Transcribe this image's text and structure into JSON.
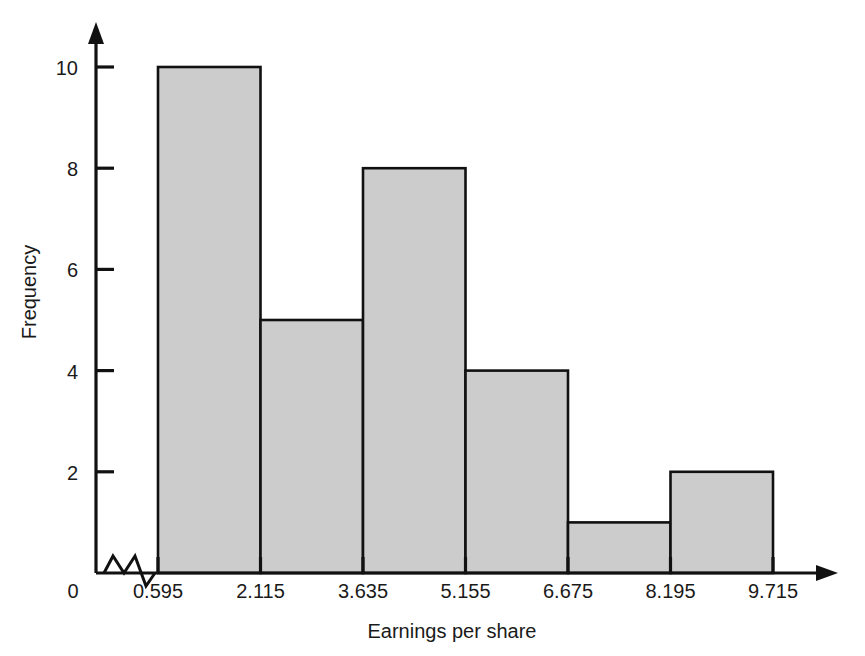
{
  "chart_data": {
    "type": "bar",
    "title": "",
    "subtitle": "",
    "xlabel": "Earnings per share",
    "ylabel": "Frequency",
    "categories": [
      "0.595-2.115",
      "2.115-3.635",
      "3.635-5.155",
      "5.155-6.675",
      "6.675-8.195",
      "8.195-9.715"
    ],
    "bin_edges": [
      0.595,
      2.115,
      3.635,
      5.155,
      6.675,
      8.195,
      9.715
    ],
    "values": [
      10,
      5,
      8,
      4,
      1,
      2
    ],
    "bin_width": 1.52,
    "xtick_labels": [
      "0",
      "0.595",
      "2.115",
      "3.635",
      "5.155",
      "6.675",
      "8.195",
      "9.715"
    ],
    "ytick_labels": [
      "0",
      "2",
      "4",
      "6",
      "8",
      "10"
    ],
    "ytick_values": [
      0,
      2,
      4,
      6,
      8,
      10
    ],
    "xlim": [
      0.595,
      9.715
    ],
    "ylim": [
      0,
      10
    ],
    "grid": false,
    "legend": false,
    "axis_break": true,
    "bar_fill_color": "#cccccc",
    "bar_edge_color": "#111111",
    "axis_color": "#111111",
    "background_color": "#ffffff"
  },
  "figure": {
    "origin_label": "0",
    "x_axis_arrow": true,
    "y_axis_arrow": true
  }
}
